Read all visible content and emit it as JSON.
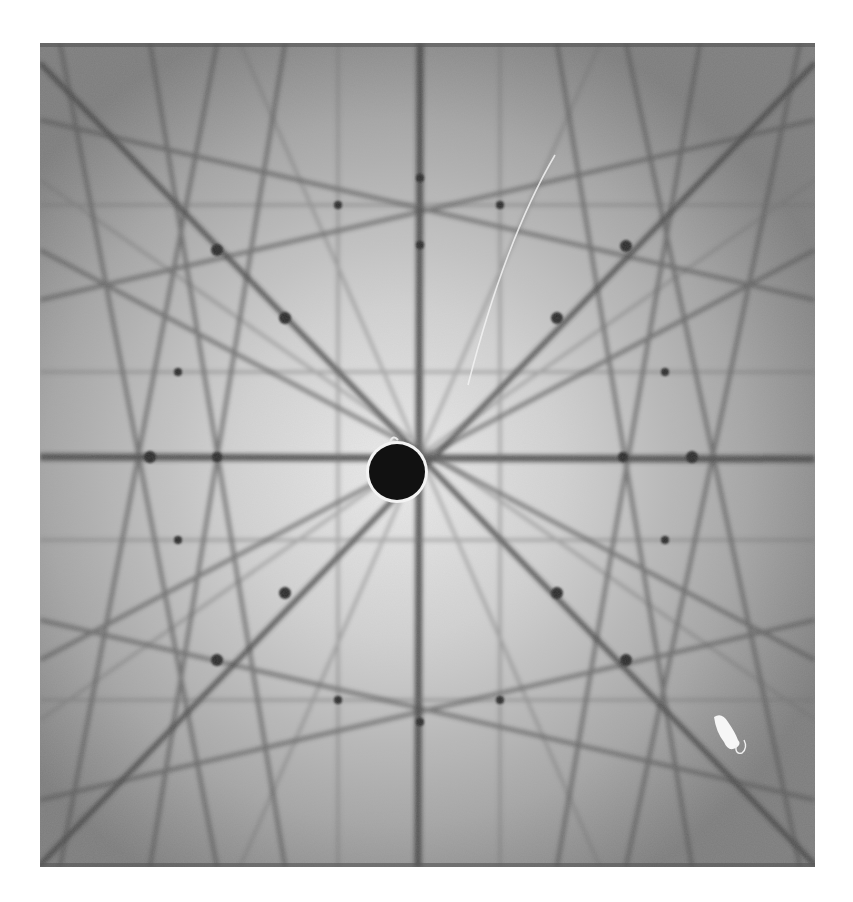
{
  "image": {
    "subject": "Kikuchi diffraction pattern photograph",
    "background_color": "#ffffff",
    "plate": {
      "x": 40,
      "y": 43,
      "width": 775,
      "height": 824,
      "base_color": "#9a9a9a",
      "center_glow": "#e6e6e6",
      "edge_color": "#6e6e6e"
    },
    "center_spot": {
      "cx": 397,
      "cy": 472,
      "r": 28,
      "fill": "#111111",
      "ring": "#f4f4f4"
    },
    "band_color": "#3e3e3e",
    "main_lines": {
      "vertical_x": 420,
      "horizontal_y": 457
    },
    "poles": [
      [
        217,
        250
      ],
      [
        285,
        318
      ],
      [
        557,
        318
      ],
      [
        626,
        246
      ],
      [
        150,
        457
      ],
      [
        217,
        457
      ],
      [
        623,
        457
      ],
      [
        692,
        457
      ],
      [
        285,
        593
      ],
      [
        557,
        593
      ],
      [
        217,
        660
      ],
      [
        626,
        660
      ],
      [
        420,
        178
      ],
      [
        420,
        245
      ],
      [
        420,
        722
      ],
      [
        338,
        205
      ],
      [
        500,
        205
      ],
      [
        338,
        700
      ],
      [
        500,
        700
      ],
      [
        178,
        372
      ],
      [
        665,
        372
      ],
      [
        178,
        540
      ],
      [
        665,
        540
      ]
    ],
    "artifacts": {
      "scratch": "white curved scratch in upper right quadrant",
      "blob": "white irregular mark near lower right"
    }
  }
}
